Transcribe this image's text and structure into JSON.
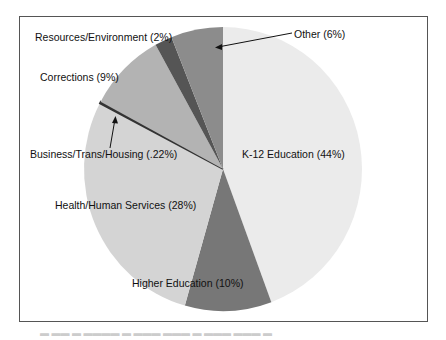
{
  "chart_data": {
    "type": "pie",
    "title": "",
    "slices": [
      {
        "label": "K-12 Education",
        "value": 44,
        "display": "K-12 Education (44%)",
        "color": "#ebebeb"
      },
      {
        "label": "Higher Education",
        "value": 10,
        "display": "Higher Education (10%)",
        "color": "#777777"
      },
      {
        "label": "Health/Human Services",
        "value": 28,
        "display": "Health/Human Services (28%)",
        "color": "#d4d4d4"
      },
      {
        "label": "Business/Trans/Housing",
        "value": 0.22,
        "display": "Business/Trans/Housing (.22%)",
        "color": "#333333"
      },
      {
        "label": "Corrections",
        "value": 9,
        "display": "Corrections (9%)",
        "color": "#b3b3b3"
      },
      {
        "label": "Resources/Environment",
        "value": 2,
        "display": "Resources/Environment (2%)",
        "color": "#555555"
      },
      {
        "label": "Other",
        "value": 6,
        "display": "Other (6%)",
        "color": "#8c8c8c"
      }
    ],
    "start_angle": "12 o'clock, clockwise",
    "legend": "none (direct labels)"
  },
  "labels": {
    "k12": "K-12 Education (44%)",
    "higher": "Higher Education (10%)",
    "health": "Health/Human Services (28%)",
    "business": "Business/Trans/Housing (.22%)",
    "corrections": "Corrections (9%)",
    "resources": "Resources/Environment (2%)",
    "other": "Other (6%)"
  }
}
